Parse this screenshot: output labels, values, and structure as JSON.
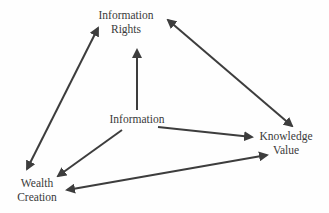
{
  "diagram": {
    "type": "concept-relationship-diagram",
    "nodes": [
      {
        "id": "information_rights",
        "line1": "Information",
        "line2": "Rights"
      },
      {
        "id": "information",
        "line1": "Information"
      },
      {
        "id": "knowledge_value",
        "line1": "Knowledge",
        "line2": "Value"
      },
      {
        "id": "wealth_creation",
        "line1": "Wealth",
        "line2": "Creation"
      }
    ],
    "edges": [
      {
        "from": "information",
        "to": "information_rights",
        "direction": "one-way"
      },
      {
        "from": "information",
        "to": "knowledge_value",
        "direction": "one-way"
      },
      {
        "from": "information",
        "to": "wealth_creation",
        "direction": "one-way"
      },
      {
        "from": "wealth_creation",
        "to": "information_rights",
        "direction": "two-way"
      },
      {
        "from": "information_rights",
        "to": "knowledge_value",
        "direction": "two-way"
      },
      {
        "from": "wealth_creation",
        "to": "knowledge_value",
        "direction": "two-way"
      }
    ],
    "colors": {
      "arrow": "#3d3d3d",
      "text": "#3a3a3a",
      "background": "#fefefe"
    }
  }
}
